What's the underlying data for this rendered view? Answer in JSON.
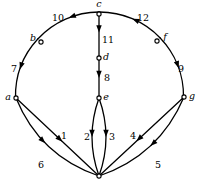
{
  "figure": {
    "background_color": "#ffffff",
    "stroke_color": "#000000",
    "width": 199,
    "height": 188
  },
  "nodes": [
    {
      "id": "a",
      "label": "a",
      "x": 16,
      "y": 98,
      "style": "open",
      "label_dx": -8,
      "label_dy": 2
    },
    {
      "id": "b",
      "label": "b",
      "x": 41,
      "y": 42,
      "style": "open",
      "label_dx": -8,
      "label_dy": -1
    },
    {
      "id": "c",
      "label": "c",
      "x": 99,
      "y": 14,
      "style": "open",
      "label_dx": 0,
      "label_dy": -7
    },
    {
      "id": "d",
      "label": "d",
      "x": 99,
      "y": 58,
      "style": "open",
      "label_dx": 7,
      "label_dy": 2
    },
    {
      "id": "e",
      "label": "e",
      "x": 99,
      "y": 98,
      "style": "open",
      "label_dx": 7,
      "label_dy": 2
    },
    {
      "id": "f",
      "label": "f",
      "x": 157,
      "y": 41,
      "style": "open",
      "label_dx": 8,
      "label_dy": -1
    },
    {
      "id": "g",
      "label": "g",
      "x": 184,
      "y": 97,
      "style": "open",
      "label_dx": 8,
      "label_dy": 2
    },
    {
      "id": "h",
      "label": "",
      "x": 99,
      "y": 176,
      "style": "open",
      "label_dx": 0,
      "label_dy": 0
    }
  ],
  "edges": [
    {
      "id": "e1",
      "label": "1",
      "from": "a",
      "to": "h",
      "label_x": 64,
      "label_y": 139,
      "arrow_at": 0.56
    },
    {
      "id": "e2",
      "label": "2",
      "from": "e",
      "to": "h",
      "label_x": 87,
      "label_y": 140,
      "arrow_at": 0.5
    },
    {
      "id": "e3",
      "label": "3",
      "from": "e",
      "to": "h",
      "label_x": 112,
      "label_y": 140,
      "arrow_at": 0.5
    },
    {
      "id": "e4",
      "label": "4",
      "from": "g",
      "to": "h",
      "label_x": 133,
      "label_y": 139,
      "arrow_at": 0.56
    },
    {
      "id": "e5",
      "label": "5",
      "from": "g",
      "to": "h",
      "label_x": 158,
      "label_y": 168,
      "arrow_at": 0.5
    },
    {
      "id": "e6",
      "label": "6",
      "from": "a",
      "to": "h",
      "label_x": 41,
      "label_y": 168,
      "arrow_at": 0.46
    },
    {
      "id": "e7",
      "label": "7",
      "from": "b",
      "to": "a",
      "label_x": 14,
      "label_y": 72,
      "arrow_at": 0.55
    },
    {
      "id": "e8",
      "label": "8",
      "from": "d",
      "to": "e",
      "label_x": 107,
      "label_y": 81,
      "arrow_at": 0.5
    },
    {
      "id": "e9",
      "label": "9",
      "from": "f",
      "to": "g",
      "label_x": 181,
      "label_y": 72,
      "arrow_at": 0.55
    },
    {
      "id": "e10",
      "label": "10",
      "from": "c",
      "to": "b",
      "label_x": 58,
      "label_y": 21,
      "arrow_at": 0.45
    },
    {
      "id": "e11",
      "label": "11",
      "from": "c",
      "to": "d",
      "label_x": 108,
      "label_y": 43,
      "arrow_at": 0.42
    },
    {
      "id": "e12",
      "label": "12",
      "from": "f",
      "to": "c",
      "label_x": 143,
      "label_y": 21,
      "arrow_at": 0.5
    }
  ],
  "edge_geometry": {
    "e1": {
      "type": "line",
      "curve": 0
    },
    "e2": {
      "type": "curve",
      "curve": -14
    },
    "e3": {
      "type": "curve",
      "curve": 14
    },
    "e4": {
      "type": "line",
      "curve": 0
    },
    "e5": {
      "type": "curve",
      "curve": -26
    },
    "e6": {
      "type": "curve",
      "curve": 26
    },
    "e7": {
      "type": "arc",
      "curve": 0
    },
    "e8": {
      "type": "line",
      "curve": 0
    },
    "e9": {
      "type": "arc",
      "curve": 0
    },
    "e10": {
      "type": "arc",
      "curve": 0
    },
    "e11": {
      "type": "line",
      "curve": 0
    },
    "e12": {
      "type": "arc",
      "curve": 0
    }
  },
  "outer_circle": {
    "cx": 99.5,
    "cy": 96,
    "r": 84
  }
}
